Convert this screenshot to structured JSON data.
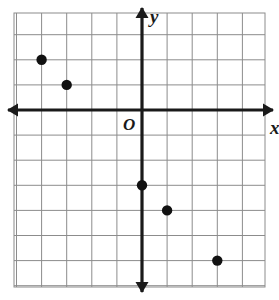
{
  "figure": {
    "kind": "coordinate-plane-scatter",
    "background_color": "#ffffff",
    "grid_color": "#8c8c8c",
    "axis_color": "#1a1a1a",
    "point_color": "#111111"
  },
  "labels": {
    "x_axis": "x",
    "y_axis": "y",
    "origin": "O"
  },
  "chart_data": {
    "type": "scatter",
    "title": "",
    "xlabel": "x",
    "ylabel": "y",
    "origin_label": "O",
    "grid": true,
    "legend": null,
    "xlim": [
      -5,
      5
    ],
    "ylim": [
      -7,
      4
    ],
    "xticks": [
      -5,
      -4,
      -3,
      -2,
      -1,
      0,
      1,
      2,
      3,
      4,
      5
    ],
    "yticks": [
      -7,
      -6,
      -5,
      -4,
      -3,
      -2,
      -1,
      0,
      1,
      2,
      3,
      4
    ],
    "tick_labels_shown": false,
    "points": [
      {
        "x": -4,
        "y": 2
      },
      {
        "x": -3,
        "y": 1
      },
      {
        "x": 0,
        "y": -3
      },
      {
        "x": 1,
        "y": -4
      },
      {
        "x": 3,
        "y": -6
      }
    ]
  },
  "geometry": {
    "grid_left": 14,
    "grid_top": 13,
    "grid_right": 265,
    "grid_bottom": 287,
    "cell": 25.1,
    "origin_px_x": 142,
    "origin_px_y": 110,
    "point_radius": 5.2,
    "axis_stroke": 3.2,
    "grid_stroke": 1
  }
}
